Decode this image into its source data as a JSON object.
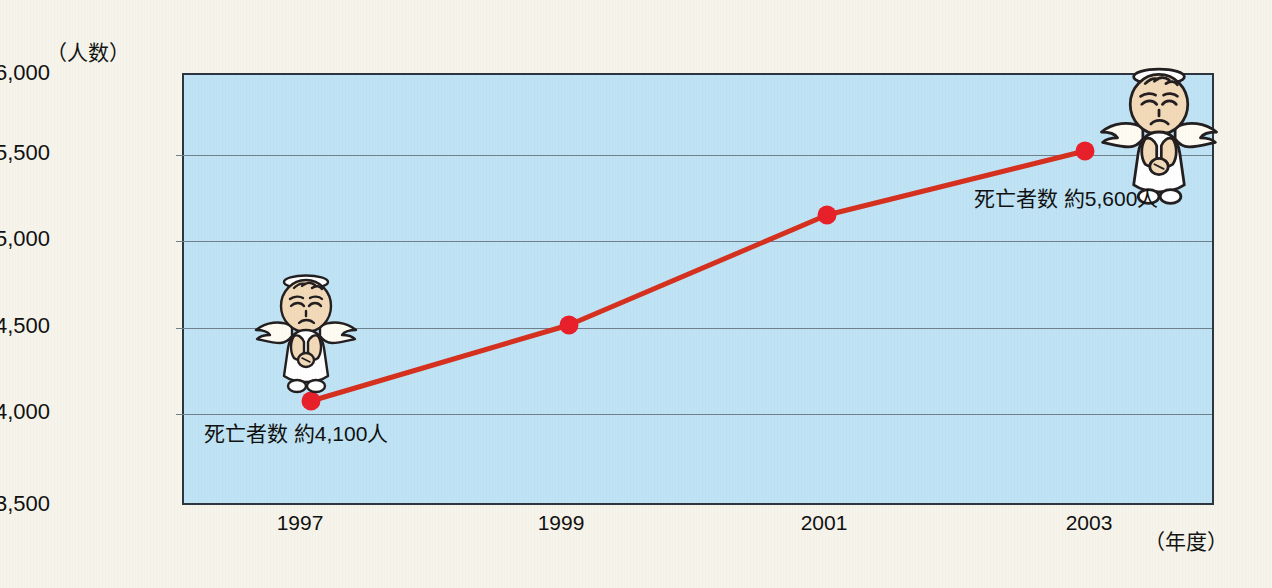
{
  "chart_data": {
    "type": "line",
    "title": "",
    "subtitle": "",
    "xlabel": "（年度）",
    "ylabel": "（人数）",
    "x": [
      "1997",
      "1999",
      "2001",
      "2003"
    ],
    "categories": [
      "1997",
      "1999",
      "2001",
      "2003"
    ],
    "values": [
      4100,
      4540,
      5180,
      5550
    ],
    "series": [
      {
        "name": "死亡者数",
        "values": [
          4100,
          4540,
          5180,
          5550
        ]
      }
    ],
    "ylim": [
      3500,
      6000
    ],
    "yticks": [
      "3,500",
      "4,000",
      "4,500",
      "5,000",
      "5,500",
      "6,000"
    ],
    "ytick_values": [
      3500,
      4000,
      4500,
      5000,
      5500,
      6000
    ],
    "xticks": [
      "1997",
      "1999",
      "2001",
      "2003"
    ],
    "grid": true,
    "legend": false,
    "legend_position": "none",
    "line_color": "#d6301f",
    "marker_color": "#e8202a",
    "plot_background": "#bfe3f4",
    "page_background": "#f6f4ea",
    "annotations": [
      {
        "id": "start",
        "text": "死亡者数 約4,100人",
        "x": "1997",
        "value": 4100
      },
      {
        "id": "end",
        "text": "死亡者数 約5,600人",
        "x": "2003",
        "value": 5600
      }
    ],
    "illustrations": [
      {
        "id": "angel-1997",
        "name": "sad-angel",
        "at_x": "1997"
      },
      {
        "id": "angel-2003",
        "name": "sad-angel",
        "at_x": "2003"
      }
    ]
  },
  "axes": {
    "y_title": "（人数）",
    "x_title": "（年度）",
    "y_tick_labels": [
      "6,000",
      "5,500",
      "5,000",
      "4,500",
      "4,000",
      "3,500"
    ],
    "x_tick_labels": [
      "1997",
      "1999",
      "2001",
      "2003"
    ]
  },
  "annotations": {
    "start_label": "死亡者数 約4,100人",
    "end_label": "死亡者数 約5,600人"
  }
}
